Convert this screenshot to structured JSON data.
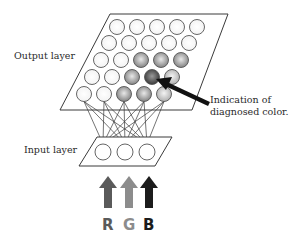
{
  "labels": {
    "output_layer": "Output layer",
    "input_layer": "Input layer",
    "annotation_line1": "Indication of",
    "annotation_line2": "diagnosed color."
  },
  "channels": [
    {
      "letter": "R",
      "color": "#5a5a5a"
    },
    {
      "letter": "G",
      "color": "#8c8c8c"
    },
    {
      "letter": "B",
      "color": "#1c1c1c"
    }
  ],
  "output_layer": {
    "rows": 5,
    "cols": 5,
    "shading": [
      [
        "white",
        "white",
        "white",
        "white",
        "white"
      ],
      [
        "white",
        "white",
        "white",
        "white",
        "white"
      ],
      [
        "white",
        "white",
        "mid",
        "mid",
        "mid"
      ],
      [
        "white",
        "white",
        "mid",
        "dark",
        "light"
      ],
      [
        "white",
        "white",
        "mid",
        "mid",
        "light"
      ]
    ],
    "diagnosed_node": {
      "row": 4,
      "col": 4
    }
  },
  "input_layer": {
    "nodes": 3
  },
  "colors": {
    "stroke": "#3a3a3a",
    "white_fill": "#fbfbfb",
    "light_fill": "#c9c9c9",
    "mid_fill": "#9a9a9a",
    "dark_fill": "#4a4a4a",
    "annotation_arrow": "#111111"
  }
}
